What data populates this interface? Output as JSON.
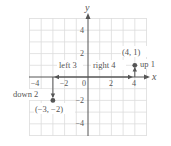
{
  "diagram": {
    "type": "coordinate-plane",
    "axes": {
      "x_label": "x",
      "y_label": "y"
    },
    "grid": {
      "xmin": -5,
      "xmax": 5,
      "ymin": -5,
      "ymax": 5
    },
    "x_ticks": [
      "−4",
      "−2",
      "0",
      "2",
      "4"
    ],
    "y_ticks": [
      "4",
      "2",
      "−2",
      "−4"
    ],
    "points": [
      {
        "label": "(4, 1)",
        "x": 4,
        "y": 1
      },
      {
        "label": "(−3, −2)",
        "x": -3,
        "y": -2
      }
    ],
    "moves": [
      {
        "label": "left 3"
      },
      {
        "label": "right 4"
      },
      {
        "label": "up 1"
      },
      {
        "label": "down 2"
      }
    ]
  },
  "colors": {
    "grid": "#d8d8d8",
    "axis": "#555555",
    "point": "#555555",
    "text": "#555555"
  }
}
